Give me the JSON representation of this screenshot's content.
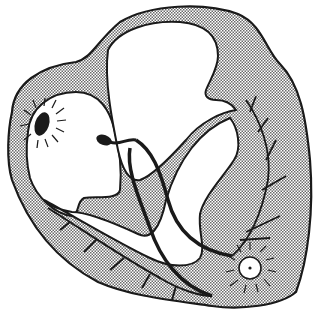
{
  "diagram": {
    "style": "black line art with stippled myocardium",
    "colors": {
      "background": "#ffffff",
      "stroke": "#1a1a1a",
      "stipple": "#c8c8c8",
      "chamber": "#ffffff"
    },
    "components": [
      {
        "id": "sa-node",
        "label": "",
        "shape": "dark oval with radiating lines",
        "cx": 42,
        "cy": 124
      },
      {
        "id": "av-node",
        "label": "",
        "shape": "dark tadpole blob",
        "cx": 106,
        "cy": 141
      },
      {
        "id": "bundle-branches",
        "label": "",
        "shape": "two thick lines descending through septum"
      },
      {
        "id": "purkinje-fibers",
        "label": "",
        "shape": "branching lines in ventricular walls"
      },
      {
        "id": "ectopic-focus",
        "label": "",
        "shape": "white circle with center dot and radiating lines",
        "cx": 250,
        "cy": 268
      }
    ],
    "text_labels": []
  }
}
